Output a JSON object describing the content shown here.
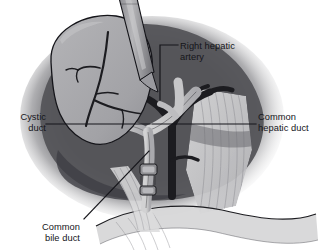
{
  "figure": {
    "background_color": "#ffffff",
    "width": 321,
    "height": 251,
    "style": "grayscale medical line illustration"
  },
  "palette": {
    "background": "#ffffff",
    "liver_dark": "#55555a",
    "liver_shadow": "#3e3e43",
    "gallbladder_gray": "#a8a8ab",
    "duct_light": "#c3c3c4",
    "vessel_black": "#1c1c20",
    "fibrous_tissue": "#cfcfd0",
    "clip_gray": "#8e8e92",
    "outline": "#15151a",
    "label_text": "#15151a",
    "leader_line": "#15151a"
  },
  "labels": [
    {
      "id": "right-hepatic-artery",
      "text": "Right hepatic\nartery",
      "structure": "right hepatic artery",
      "align": "left",
      "leader": "elbow: horizontal from text leftward, then vertical down to vessel"
    },
    {
      "id": "cystic-duct",
      "text": "Cystic\nduct",
      "structure": "cystic duct",
      "align": "right",
      "leader": "horizontal line rightward to duct"
    },
    {
      "id": "common-hepatic-duct",
      "text": "Common\nhepatic duct",
      "structure": "common hepatic duct",
      "align": "left",
      "leader": "horizontal line leftward to duct"
    },
    {
      "id": "common-bile-duct",
      "text": "Common\nbile duct",
      "structure": "common bile duct",
      "align": "right",
      "leader": "diagonal line up and to the right toward clipped duct"
    }
  ],
  "anatomy": [
    {
      "id": "gallbladder",
      "name": "gallbladder",
      "tone": "light gray ovoid, upper left, with dark surface vessels"
    },
    {
      "id": "liver",
      "name": "liver",
      "tone": "dark gray mass filling background"
    },
    {
      "id": "cystic-duct",
      "name": "cystic duct",
      "tone": "light gray tubular branch"
    },
    {
      "id": "common-hepatic-duct",
      "name": "common hepatic duct",
      "tone": "light gray tubular branch"
    },
    {
      "id": "common-bile-duct",
      "name": "common bile duct",
      "tone": "light gray duct running inferiorly, divided between clips"
    },
    {
      "id": "right-hepatic-artery",
      "name": "right hepatic artery",
      "tone": "near-black branching vessel"
    },
    {
      "id": "surgical-clips",
      "name": "surgical clips",
      "tone": "mid gray metallic bands on duct"
    },
    {
      "id": "grasper-instrument",
      "name": "laparoscopic grasper",
      "tone": "gray shaft entering from top"
    },
    {
      "id": "fibrous-tissue",
      "name": "fibrous connective tissue",
      "tone": "pale striated band, right side"
    },
    {
      "id": "duodenum",
      "name": "duodenum",
      "tone": "pale curved structure, lower right"
    }
  ]
}
